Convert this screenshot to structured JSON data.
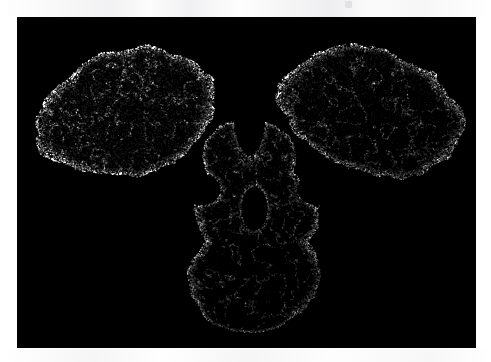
{
  "page": {
    "background_color": "#ffffff",
    "width": 491,
    "height": 362
  },
  "figure": {
    "name": "molecular-surface-figure",
    "background_color": "#000000",
    "foreground_color": "#ffffff",
    "render_style": "dot-surface",
    "panel": {
      "x": 17,
      "y": 17,
      "width": 459,
      "height": 331
    },
    "caption": "",
    "alt_text": "Dot-surface molecular rendering of a Y-shaped immunoglobulin-like macromolecule on a black background"
  },
  "chart_data": {
    "type": "scatter",
    "title": "",
    "subtitle": "",
    "xlabel": "",
    "ylabel": "",
    "legend": [],
    "grid": false,
    "axis_visible": false,
    "tick_labels": [],
    "annotations": [],
    "point_color": "#ffffff",
    "background": "#000000",
    "point_count": 52000,
    "xlim": [
      0,
      459
    ],
    "ylim": [
      0,
      331
    ],
    "description": "Surface-dot cloud tracing the solvent-accessible envelope of a Y/T-shaped antibody: two upper Fab lobes flanking a deep central V-notch, joined through a hinge to a lower Fc stem containing an oval interior cavity.",
    "lobes": [
      {
        "name": "fab-arm-left",
        "cx": 110,
        "cy": 95,
        "rx": 92,
        "ry": 62,
        "rot": -16,
        "density": 1.0
      },
      {
        "name": "fab-arm-right",
        "cx": 355,
        "cy": 95,
        "rx": 95,
        "ry": 62,
        "rot": 16,
        "density": 1.0
      },
      {
        "name": "hinge-region",
        "cx": 232,
        "cy": 140,
        "rx": 48,
        "ry": 40,
        "rot": 0,
        "density": 0.75
      },
      {
        "name": "fc-stem-upper",
        "cx": 238,
        "cy": 196,
        "rx": 62,
        "ry": 52,
        "rot": 0,
        "density": 0.9
      },
      {
        "name": "fc-stem-lower",
        "cx": 238,
        "cy": 256,
        "rx": 66,
        "ry": 54,
        "rot": 0,
        "density": 0.9
      },
      {
        "name": "fc-foot",
        "cx": 232,
        "cy": 288,
        "rx": 48,
        "ry": 26,
        "rot": 0,
        "density": 0.8
      }
    ],
    "cavities": [
      {
        "name": "central-v-notch",
        "cx": 232,
        "cy": 86,
        "rx": 17,
        "ry": 52
      },
      {
        "name": "fc-interior-hole",
        "cx": 237,
        "cy": 191,
        "rx": 13,
        "ry": 22
      },
      {
        "name": "left-hinge-gap",
        "cx": 183,
        "cy": 172,
        "rx": 20,
        "ry": 16
      },
      {
        "name": "right-hinge-gap",
        "cx": 300,
        "cy": 172,
        "rx": 20,
        "ry": 16
      }
    ]
  },
  "accessibility": {
    "figure_role": "img",
    "figure_label": "Molecular dot-surface rendering"
  }
}
